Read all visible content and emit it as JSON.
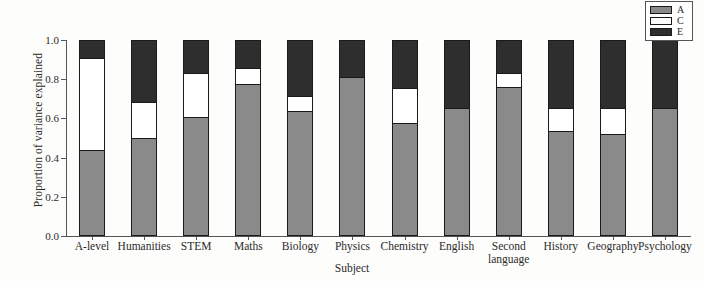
{
  "chart_data": {
    "type": "bar",
    "stacked": true,
    "title": "",
    "xlabel": "Subject",
    "ylabel": "Proportion of variance explained",
    "ylim": [
      0.0,
      1.0
    ],
    "yticks": [
      "0.0",
      "0.2",
      "0.4",
      "0.6",
      "0.8",
      "1.0"
    ],
    "ytick_values": [
      0.0,
      0.2,
      0.4,
      0.6,
      0.8,
      1.0
    ],
    "grid": false,
    "legend_position": "top-right",
    "categories": [
      "A-level",
      "Humanities",
      "STEM",
      "Maths",
      "Biology",
      "Physics",
      "Chemistry",
      "English",
      "Second\nlanguage",
      "History",
      "Geography",
      "Psychology"
    ],
    "series": [
      {
        "name": "A",
        "color": "#8a8a8a",
        "values": [
          0.44,
          0.5,
          0.605,
          0.775,
          0.64,
          0.81,
          0.575,
          0.655,
          0.76,
          0.535,
          0.52,
          0.655
        ]
      },
      {
        "name": "C",
        "color": "#ffffff",
        "values": [
          0.47,
          0.185,
          0.225,
          0.08,
          0.075,
          0.0,
          0.18,
          0.0,
          0.07,
          0.12,
          0.135,
          0.0
        ]
      },
      {
        "name": "E",
        "color": "#2e2e2e",
        "values": [
          0.09,
          0.315,
          0.17,
          0.145,
          0.285,
          0.19,
          0.245,
          0.345,
          0.17,
          0.345,
          0.345,
          0.345
        ]
      }
    ]
  },
  "legend": {
    "entries": [
      {
        "label": "A",
        "color": "#8a8a8a"
      },
      {
        "label": "C",
        "color": "#ffffff"
      },
      {
        "label": "E",
        "color": "#2e2e2e"
      }
    ]
  }
}
